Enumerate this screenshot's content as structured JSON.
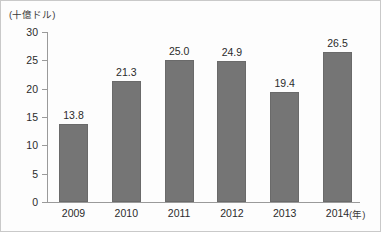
{
  "chart_data": {
    "type": "bar",
    "title": "",
    "subtitle": "",
    "xlabel": "(年)",
    "ylabel": "(十億ドル)",
    "categories": [
      "2009",
      "2010",
      "2011",
      "2012",
      "2013",
      "2014"
    ],
    "values": [
      13.8,
      21.3,
      25.0,
      24.9,
      19.4,
      26.5
    ],
    "value_labels": [
      "13.8",
      "21.3",
      "25.0",
      "24.9",
      "19.4",
      "26.5"
    ],
    "ylim": [
      0,
      30
    ],
    "ytick_labels": [
      "0",
      "5",
      "10",
      "15",
      "20",
      "25",
      "30"
    ],
    "ytick_values": [
      0,
      5,
      10,
      15,
      20,
      25,
      30
    ],
    "grid": false,
    "legend": null,
    "series": [
      {
        "name": "",
        "values": [
          13.8,
          21.3,
          25.0,
          24.9,
          19.4,
          26.5
        ]
      }
    ],
    "colors": {
      "bar_fill": "#757575",
      "bar_stroke": "#6a6a6a",
      "axis": "#9a9a9a",
      "text": "#2b2b2b",
      "background": "#fdfdfd"
    }
  }
}
